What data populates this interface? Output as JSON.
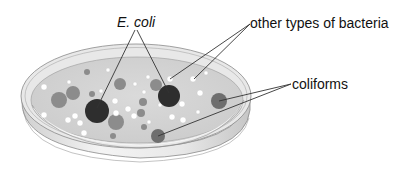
{
  "diagram": {
    "labels": [
      {
        "id": "ecoli",
        "text": "E. coli",
        "italic": true
      },
      {
        "id": "other",
        "text": "other types of bacteria",
        "italic": false
      },
      {
        "id": "coli",
        "text": "coliforms",
        "italic": false
      }
    ],
    "colors": {
      "agar": "#d4d4d4",
      "rim": "#e6e6e6",
      "dish_side": "#dcdcdc",
      "outline": "#8a8a8a",
      "ecoli_colony": "#2e2e2e",
      "coliform_colony": "#6e6e6e",
      "grey_colony": "#8c8c8c",
      "white_colony": "#ffffff",
      "leader_line": "#333333"
    },
    "colonies": {
      "ecoli": [
        {
          "cx": 97,
          "cy": 111,
          "r": 12
        },
        {
          "cx": 169,
          "cy": 96,
          "r": 11
        }
      ],
      "coliforms": [
        {
          "cx": 219,
          "cy": 101,
          "r": 8
        },
        {
          "cx": 158,
          "cy": 136,
          "r": 7
        }
      ],
      "grey": [
        {
          "cx": 59,
          "cy": 100,
          "r": 8
        },
        {
          "cx": 73,
          "cy": 93,
          "r": 7
        },
        {
          "cx": 116,
          "cy": 122,
          "r": 8
        },
        {
          "cx": 120,
          "cy": 84,
          "r": 6
        },
        {
          "cx": 156,
          "cy": 85,
          "r": 6
        },
        {
          "cx": 143,
          "cy": 102,
          "r": 4
        },
        {
          "cx": 87,
          "cy": 72,
          "r": 3
        },
        {
          "cx": 92,
          "cy": 94,
          "r": 3
        },
        {
          "cx": 113,
          "cy": 136,
          "r": 3
        },
        {
          "cx": 144,
          "cy": 127,
          "r": 3
        },
        {
          "cx": 141,
          "cy": 113,
          "r": 4
        }
      ],
      "white": [
        {
          "cx": 44,
          "cy": 115,
          "r": 3
        },
        {
          "cx": 68,
          "cy": 120,
          "r": 3
        },
        {
          "cx": 75,
          "cy": 116,
          "r": 3
        },
        {
          "cx": 80,
          "cy": 123,
          "r": 3
        },
        {
          "cx": 84,
          "cy": 133,
          "r": 3
        },
        {
          "cx": 44,
          "cy": 87,
          "r": 3
        },
        {
          "cx": 69,
          "cy": 82,
          "r": 2
        },
        {
          "cx": 108,
          "cy": 70,
          "r": 2
        },
        {
          "cx": 115,
          "cy": 101,
          "r": 3
        },
        {
          "cx": 116,
          "cy": 113,
          "r": 3
        },
        {
          "cx": 128,
          "cy": 109,
          "r": 3
        },
        {
          "cx": 134,
          "cy": 116,
          "r": 3
        },
        {
          "cx": 149,
          "cy": 122,
          "r": 2
        },
        {
          "cx": 170,
          "cy": 79,
          "r": 3
        },
        {
          "cx": 193,
          "cy": 79,
          "r": 3
        },
        {
          "cx": 200,
          "cy": 93,
          "r": 3
        },
        {
          "cx": 182,
          "cy": 104,
          "r": 3
        },
        {
          "cx": 183,
          "cy": 120,
          "r": 3
        },
        {
          "cx": 172,
          "cy": 117,
          "r": 3
        },
        {
          "cx": 148,
          "cy": 77,
          "r": 2
        },
        {
          "cx": 206,
          "cy": 73,
          "r": 2
        },
        {
          "cx": 135,
          "cy": 84,
          "r": 2
        },
        {
          "cx": 144,
          "cy": 92,
          "r": 2
        },
        {
          "cx": 101,
          "cy": 91,
          "r": 2
        },
        {
          "cx": 198,
          "cy": 112,
          "r": 2
        },
        {
          "cx": 160,
          "cy": 105,
          "r": 2
        }
      ]
    },
    "leader_lines": [
      {
        "target": "ecoli",
        "x1": 135,
        "y1": 30,
        "x2": 97,
        "y2": 108
      },
      {
        "target": "ecoli",
        "x1": 137,
        "y1": 30,
        "x2": 169,
        "y2": 93
      },
      {
        "target": "other",
        "x1": 250,
        "y1": 24,
        "x2": 170,
        "y2": 79
      },
      {
        "target": "other",
        "x1": 250,
        "y1": 24,
        "x2": 194,
        "y2": 79
      },
      {
        "target": "coli",
        "x1": 291,
        "y1": 84,
        "x2": 219,
        "y2": 101
      },
      {
        "target": "coli",
        "x1": 291,
        "y1": 84,
        "x2": 158,
        "y2": 136
      }
    ]
  }
}
